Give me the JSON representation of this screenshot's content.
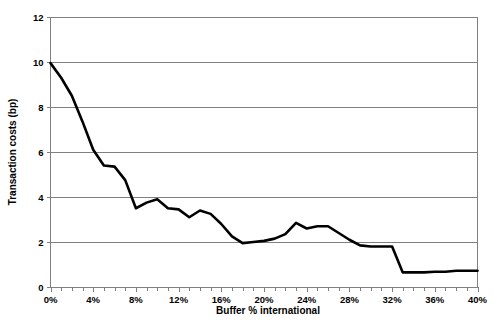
{
  "chart_data": {
    "type": "line",
    "title": "",
    "xlabel": "Buffer % international",
    "ylabel": "Transaction costs (bp)",
    "xlim": [
      0,
      40
    ],
    "ylim": [
      0,
      12
    ],
    "grid": true,
    "legend": false,
    "x_tick_labels": [
      "0%",
      "4%",
      "8%",
      "12%",
      "16%",
      "20%",
      "24%",
      "28%",
      "32%",
      "36%",
      "40%"
    ],
    "x_tick_values": [
      0,
      4,
      8,
      12,
      16,
      20,
      24,
      28,
      32,
      36,
      40
    ],
    "x_minor_tick_step": 1,
    "y_tick_labels": [
      "0",
      "2",
      "4",
      "6",
      "8",
      "10",
      "12"
    ],
    "y_tick_values": [
      0,
      2,
      4,
      6,
      8,
      10,
      12
    ],
    "series": [
      {
        "name": "Transaction costs",
        "color": "#000000",
        "x": [
          0,
          1,
          2,
          3,
          4,
          5,
          6,
          7,
          8,
          9,
          10,
          11,
          12,
          13,
          14,
          15,
          16,
          17,
          18,
          19,
          20,
          21,
          22,
          23,
          24,
          25,
          26,
          27,
          28,
          29,
          30,
          31,
          32,
          33,
          34,
          35,
          36,
          37,
          38,
          39,
          40
        ],
        "values": [
          9.95,
          9.3,
          8.5,
          7.35,
          6.1,
          5.4,
          5.35,
          4.75,
          3.5,
          3.75,
          3.9,
          3.5,
          3.45,
          3.1,
          3.4,
          3.25,
          2.8,
          2.25,
          1.95,
          2.0,
          2.05,
          2.15,
          2.35,
          2.85,
          2.6,
          2.7,
          2.7,
          2.4,
          2.1,
          1.85,
          1.8,
          1.8,
          1.8,
          0.65,
          0.65,
          0.65,
          0.68,
          0.68,
          0.72,
          0.72,
          0.72
        ]
      }
    ]
  },
  "axes": {
    "y_axis_title": "Transaction costs (bp)",
    "x_axis_title": "Buffer % international"
  }
}
